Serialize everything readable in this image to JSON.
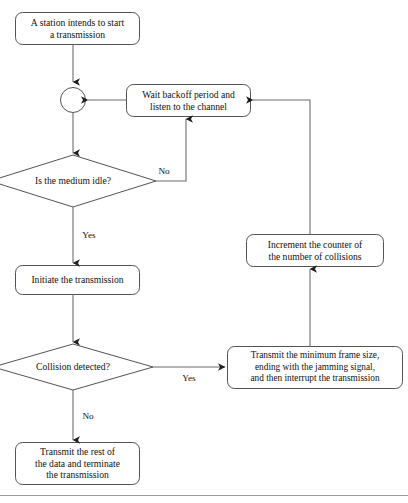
{
  "diagram": {
    "background_color": "#ffffff",
    "stroke_color": "#3a3a3a",
    "text_color": "#111111",
    "nodes": {
      "start_box": {
        "label": "A station intends to start\na transmission",
        "shape": "rounded-rectangle"
      },
      "junction": {
        "label": "",
        "shape": "circle"
      },
      "wait_backoff_box": {
        "label": "Wait backoff period and\nlisten to the channel",
        "shape": "rounded-rectangle"
      },
      "medium_idle_decision": {
        "label": "Is the medium idle?",
        "shape": "diamond"
      },
      "initiate_box": {
        "label": "Initiate the transmission",
        "shape": "rounded-rectangle"
      },
      "collision_decision": {
        "label": "Collision detected?",
        "shape": "diamond"
      },
      "jam_box": {
        "label": "Transmit the minimum frame size,\nending with the jamming signal,\nand then interrupt the transmission",
        "shape": "rounded-rectangle"
      },
      "increment_box": {
        "label": "Increment the counter of\nthe number of collisions",
        "shape": "rounded-rectangle"
      },
      "finish_box": {
        "label": "Transmit the rest of\nthe data and terminate\nthe transmission",
        "shape": "rounded-rectangle"
      }
    },
    "edge_labels": {
      "medium_idle_no": "No",
      "medium_idle_yes": "Yes",
      "collision_yes": "Yes",
      "collision_no": "No"
    },
    "footer_rule": {
      "color": "#9a9a9a"
    }
  }
}
